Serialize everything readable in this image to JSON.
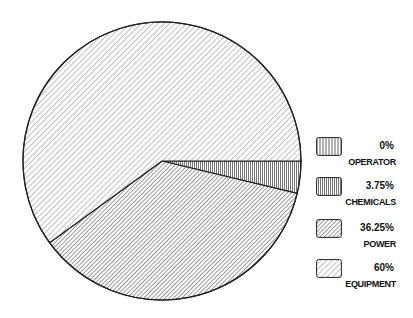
{
  "chart_data": {
    "type": "pie",
    "title": "",
    "categories": [
      "OPERATOR",
      "CHEMICALS",
      "POWER",
      "EQUIPMENT"
    ],
    "values": [
      0,
      3.75,
      36.25,
      60
    ],
    "value_labels": [
      "0%",
      "3.75%",
      "36.25%",
      "60%"
    ],
    "fill_patterns": [
      "vertical-hatch",
      "dense-vertical-hatch",
      "dense-diagonal-hatch",
      "light-diagonal-hatch"
    ],
    "start_angle_deg": 0,
    "direction": "clockwise",
    "legend_position": "right",
    "grid": false
  },
  "legend": {
    "items": [
      {
        "pct": "0%",
        "label": "OPERATOR"
      },
      {
        "pct": "3.75%",
        "label": "CHEMICALS"
      },
      {
        "pct": "36.25%",
        "label": "POWER"
      },
      {
        "pct": "60%",
        "label": "EQUIPMENT"
      }
    ]
  },
  "colors": {
    "outline": "#222222",
    "hatch": "#555555",
    "background": "#ffffff"
  }
}
